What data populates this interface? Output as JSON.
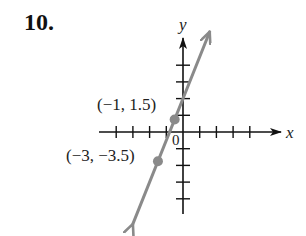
{
  "problem": {
    "number_label": "10."
  },
  "chart_data": {
    "type": "line",
    "title": "",
    "xlabel": "x",
    "ylabel": "y",
    "origin_label": "0",
    "xlim": [
      -5,
      6
    ],
    "ylim": [
      -5,
      6
    ],
    "tick_spacing": 2,
    "x_ticks": [
      -8,
      -6,
      -4,
      -2,
      2,
      4,
      6,
      8
    ],
    "y_ticks": [
      -8,
      -6,
      -4,
      -2,
      2,
      4,
      6,
      8
    ],
    "grid": false,
    "series": [
      {
        "name": "line",
        "equation": "y = 2.5x + 4",
        "slope": 2.5,
        "intercept": 4,
        "x": [
          -6,
          3.2
        ],
        "y": [
          -11,
          12
        ],
        "arrows": "both",
        "color": "#8a8a8a"
      }
    ],
    "points": [
      {
        "x": -1,
        "y": 1.5,
        "label": "(−1, 1.5)"
      },
      {
        "x": -3,
        "y": -3.5,
        "label": "(−3, −3.5)"
      }
    ],
    "colors": {
      "axes": "#111111",
      "line": "#8a8a8a",
      "points": "#8a8a8a"
    }
  }
}
